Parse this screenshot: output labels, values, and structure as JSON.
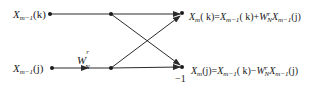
{
  "diagram": {
    "type": "butterfly",
    "inputs": [
      {
        "id": "top",
        "symbol": "X",
        "sub": "m−1",
        "arg": "k"
      },
      {
        "id": "bottom",
        "symbol": "X",
        "sub": "m−1",
        "arg": "j"
      }
    ],
    "twiddle": {
      "symbol": "W",
      "sub": "N",
      "sup": "r"
    },
    "outputs": [
      {
        "id": "top",
        "lhs_sub": "m",
        "lhs_arg": "k",
        "formula": "X_m(k)=X_{m−1}(k)+W_N^r X_{m−1}(j)",
        "op": "+"
      },
      {
        "id": "bottom",
        "lhs_sub": "m",
        "lhs_arg": "j",
        "formula": "X_m(j)=X_{m−1}(k)−W_N^r X_{m−1}(j)",
        "op": "−"
      }
    ],
    "bottom_output_multiplier": "−1",
    "colors": {
      "line": "#2a2a2a",
      "text": "#1a1a1a"
    }
  },
  "labels": {
    "in_top_sym": "X",
    "in_top_sub": "m−1",
    "in_top_arg": "(k)",
    "in_bot_sym": "X",
    "in_bot_sub": "m−1",
    "in_bot_arg": "(j)",
    "w_sym": "W",
    "w_sub": "N",
    "w_sup": "r",
    "out_top": {
      "a": "X",
      "a_sub": "m",
      "a_arg": "( k)=",
      "b": "X",
      "b_sub": "m−1",
      "b_arg": "( k)+",
      "w": "W",
      "w_sub": "N",
      "w_sup": "r",
      "c": "X",
      "c_sub": "m−1",
      "c_arg": "(j)"
    },
    "out_bot": {
      "a": "X",
      "a_sub": "m",
      "a_arg": "(j)=",
      "b": "X",
      "b_sub": "m−1",
      "b_arg": "( k)−",
      "w": "W",
      "w_sub": "N",
      "w_sup": "r",
      "c": "X",
      "c_sub": "m−1",
      "c_arg": "(j)"
    },
    "minus_one": "−1"
  }
}
